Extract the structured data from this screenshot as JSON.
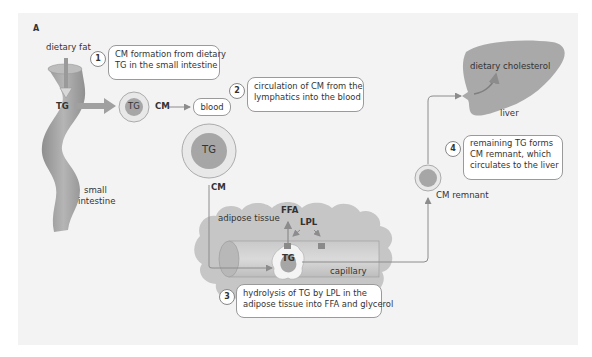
{
  "panel_label": "A",
  "labels": {
    "dietary_fat": "dietary fat",
    "tg_intestine": "TG",
    "small_intestine_line1": "small",
    "small_intestine_line2": "intestine",
    "tg_small_cm": "TG",
    "cm_label_1": "CM",
    "blood": "blood",
    "tg_large_cm": "TG",
    "cm_label_2": "CM",
    "adipose_tissue": "adipose tissue",
    "ffa": "FFA",
    "lpl": "LPL",
    "tg_capillary": "TG",
    "capillary": "capillary",
    "cm_remnant": "CM remnant",
    "dietary_cholesterol": "dietary cholesterol",
    "liver": "liver"
  },
  "steps": [
    {
      "number": "1",
      "line1": "CM formation from dietary",
      "line2": "TG in the small intestine"
    },
    {
      "number": "2",
      "line1": "circulation of CM from the",
      "line2": "lymphatics into the blood"
    },
    {
      "number": "3",
      "line1": "hydrolysis of TG by LPL in the",
      "line2": "adipose tissue into FFA and glycerol"
    },
    {
      "number": "4",
      "line1": "remaining TG forms",
      "line2": "CM remnant, which",
      "line3": "circulates to the liver"
    }
  ],
  "colors": {
    "panel_bg": "#f3f3f3",
    "organ_gray": "#a9a9a9",
    "core_gray": "#a6a6a6",
    "shell_light": "#e6e6e6",
    "arrow_gray": "#8c8c8c"
  }
}
